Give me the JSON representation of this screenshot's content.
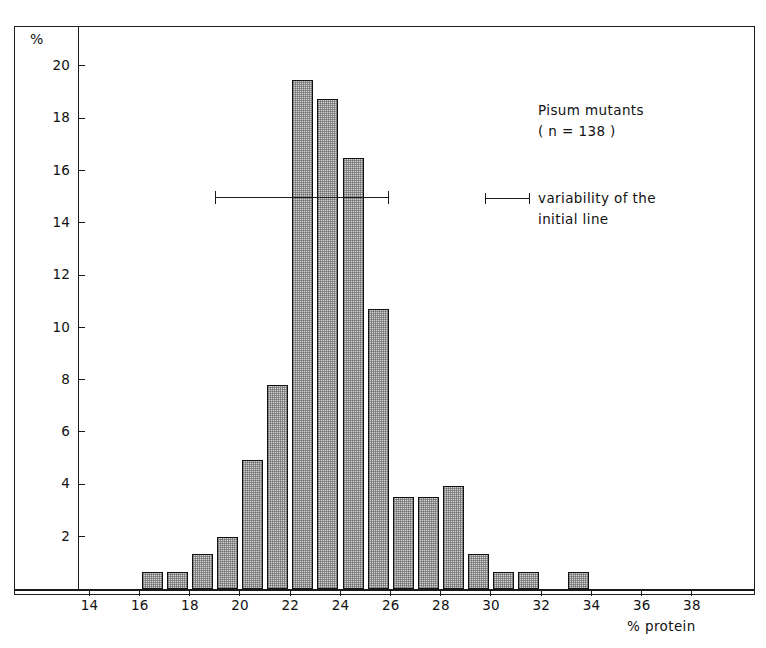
{
  "figure": {
    "axis_labels": {
      "y_unit": "%",
      "x_title": "% protein"
    },
    "annotations": {
      "title": "Pisum mutants",
      "sample_size": "( n = 138 )",
      "legend_line1": "variability of the",
      "legend_line2": "initial line"
    },
    "colors": {
      "ink": "#1a1a1a",
      "bar_fill": "#d3d3d3",
      "bar_edge": "#111111",
      "background": "#ffffff"
    }
  },
  "chart_data": {
    "type": "bar",
    "title": "Pisum mutants",
    "subtitle": "( n = 138 )",
    "xlabel": "% protein",
    "ylabel": "%",
    "xlim": [
      13,
      39
    ],
    "ylim": [
      0,
      21
    ],
    "grid": false,
    "legend_position": "upper-right",
    "x_tick_labels": [
      "14",
      "16",
      "18",
      "20",
      "22",
      "24",
      "26",
      "28",
      "30",
      "32",
      "34",
      "36",
      "38"
    ],
    "x_tick_values": [
      14,
      16,
      18,
      20,
      22,
      24,
      26,
      28,
      30,
      32,
      34,
      36,
      38
    ],
    "y_tick_labels": [
      "2",
      "4",
      "6",
      "8",
      "10",
      "12",
      "14",
      "16",
      "18",
      "20"
    ],
    "y_tick_values": [
      2,
      4,
      6,
      8,
      10,
      12,
      14,
      16,
      18,
      20
    ],
    "bin_width": 1,
    "bins": [
      {
        "bin_start": 16,
        "bin_end": 17,
        "value": 0.65
      },
      {
        "bin_start": 17,
        "bin_end": 18,
        "value": 0.65
      },
      {
        "bin_start": 18,
        "bin_end": 19,
        "value": 1.35
      },
      {
        "bin_start": 19,
        "bin_end": 20,
        "value": 2.0
      },
      {
        "bin_start": 20,
        "bin_end": 21,
        "value": 4.95
      },
      {
        "bin_start": 21,
        "bin_end": 22,
        "value": 7.8
      },
      {
        "bin_start": 22,
        "bin_end": 23,
        "value": 19.45
      },
      {
        "bin_start": 23,
        "bin_end": 24,
        "value": 18.75
      },
      {
        "bin_start": 24,
        "bin_end": 25,
        "value": 16.5
      },
      {
        "bin_start": 25,
        "bin_end": 26,
        "value": 10.7
      },
      {
        "bin_start": 26,
        "bin_end": 27,
        "value": 3.5
      },
      {
        "bin_start": 27,
        "bin_end": 28,
        "value": 3.5
      },
      {
        "bin_start": 28,
        "bin_end": 29,
        "value": 3.95
      },
      {
        "bin_start": 29,
        "bin_end": 30,
        "value": 1.35
      },
      {
        "bin_start": 30,
        "bin_end": 31,
        "value": 0.65
      },
      {
        "bin_start": 31,
        "bin_end": 32,
        "value": 0.65
      },
      {
        "bin_start": 33,
        "bin_end": 34,
        "value": 0.65
      }
    ],
    "annotations": [
      {
        "type": "error-bar",
        "label": "variability of the initial line",
        "x_start": 19.0,
        "x_end": 25.9,
        "y": 15.0
      }
    ]
  }
}
